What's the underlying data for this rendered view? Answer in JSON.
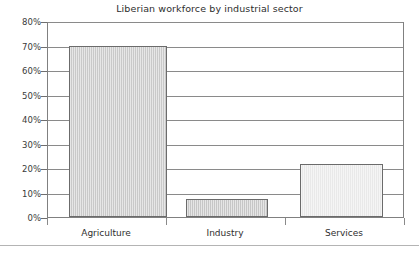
{
  "chart_data": {
    "type": "bar",
    "title": "Liberian workforce by industrial sector",
    "xlabel": "",
    "ylabel": "",
    "categories": [
      "Agriculture",
      "Industry",
      "Services"
    ],
    "values": [
      70,
      7.5,
      21.5
    ],
    "series": [
      {
        "name": "Share of workforce",
        "values": [
          70,
          7.5,
          21.5
        ]
      }
    ],
    "ylim": [
      0,
      80
    ],
    "ytick_values": [
      0,
      10,
      20,
      30,
      40,
      50,
      60,
      70,
      80
    ],
    "ytick_labels": [
      "0%",
      "10%",
      "20%",
      "30%",
      "40%",
      "50%",
      "60%",
      "70%",
      "80%"
    ],
    "grid": true,
    "legend": false,
    "legend_position": "none",
    "value_format": "percent",
    "bar_colors": [
      "#c9c9c9",
      "#c6c6c6",
      "#e9e9e9"
    ],
    "bar_edge_color": "#6b6b6b",
    "gridline_color": "#8a8a8a",
    "axis_color": "#808080",
    "title_color": "#2e2e2e",
    "background_color": "#ffffff"
  }
}
